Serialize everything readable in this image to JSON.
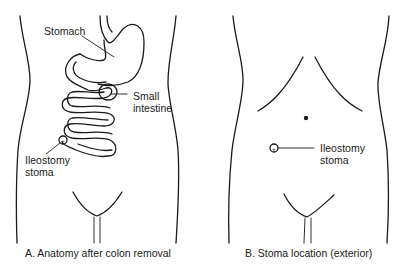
{
  "figure": {
    "panels": [
      {
        "id": "A",
        "caption": "A.  Anatomy after colon removal",
        "labels": {
          "stomach": "Stomach",
          "small_intestine_line1": "Small",
          "small_intestine_line2": "intestine",
          "ileostomy_line1": "Ileostomy",
          "ileostomy_line2": "stoma"
        }
      },
      {
        "id": "B",
        "caption": "B.  Stoma location (exterior)",
        "labels": {
          "ileostomy_line1": "Ileostomy",
          "ileostomy_line2": "stoma"
        }
      }
    ],
    "colors": {
      "line": "#1a1a1a",
      "background": "#ffffff"
    }
  }
}
